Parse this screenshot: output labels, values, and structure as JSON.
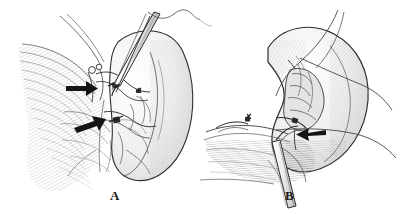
{
  "figure": {
    "background_color": "#ffffff",
    "ink_color": "#1a1a1a",
    "shade_color": "#9a9a9a",
    "width": 402,
    "height": 214
  },
  "panels": [
    {
      "id": "A",
      "label": "A",
      "caption": "Kidney hilum exposed with dissecting instrument; vascular clips indicated by solid arrows",
      "arrows": [
        {
          "name": "arrow-upper",
          "direction": "right",
          "points_to": "clipped-vessel-upper"
        },
        {
          "name": "arrow-lower",
          "direction": "right",
          "points_to": "clipped-vessel-lower"
        }
      ],
      "structures": [
        "kidney",
        "renal-hilum-vessels",
        "fascia-hatching",
        "dissecting-instrument",
        "ligature-loops",
        "suture-thread"
      ]
    },
    {
      "id": "B",
      "label": "B",
      "caption": "Kidney retracted with sutures; instrument shaft and solid arrow marking the hilar stump",
      "arrows": [
        {
          "name": "arrow-hilum",
          "direction": "left",
          "points_to": "hilar-stump"
        }
      ],
      "structures": [
        "kidney-retracted",
        "renal-hilum-stump",
        "suture-threads",
        "instrument-shaft",
        "tissue-bed-hatching",
        "vessel-stump-clip"
      ]
    }
  ]
}
